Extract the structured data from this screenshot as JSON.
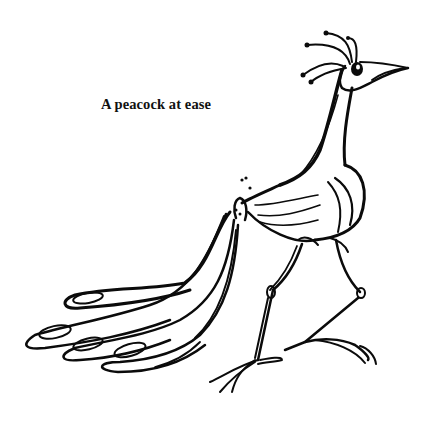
{
  "illustration": {
    "caption": "A peacock at ease",
    "subject": "peacock-line-drawing",
    "ink_color": "#0b0b0b",
    "background_color": "#ffffff"
  }
}
